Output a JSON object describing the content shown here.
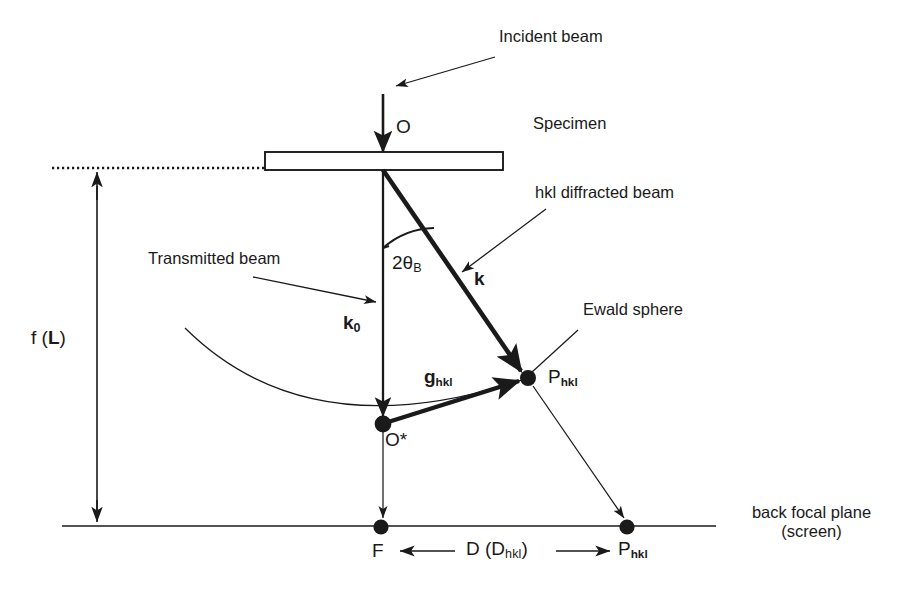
{
  "figure": {
    "type": "ray-diagram",
    "background_color": "#ffffff",
    "line_color": "#1a1a1a"
  },
  "labels": {
    "incident_beam": "Incident beam",
    "specimen": "Specimen",
    "point_O": "O",
    "hkl_diffracted_beam": "hkl diffracted beam",
    "transmitted_beam": "Transmitted beam",
    "bragg_angle": "2θ",
    "bragg_angle_sub": "B",
    "vector_k": "k",
    "vector_k0": "k",
    "vector_k0_sub": "0",
    "vector_g": "g",
    "vector_g_sub": "hkl",
    "point_O_star": "O*",
    "ewald_sphere": "Ewald sphere",
    "point_P_upper": "P",
    "point_P_upper_sub": "hkl",
    "focal_length": "f (",
    "focal_length_bold": "L",
    "focal_length_close": ")",
    "point_F": "F",
    "distance_D": "D (D",
    "distance_D_sub": "hkl",
    "distance_D_close": ")",
    "point_P_lower": "P",
    "point_P_lower_sub": "hkl",
    "back_focal_plane_line1": "back focal plane",
    "back_focal_plane_line2": "(screen)"
  },
  "geometry": {
    "optic_axis_x": 383,
    "specimen_plane_y": 161,
    "back_focal_plane_y": 526,
    "point_O": [
      383,
      161
    ],
    "point_O_star": [
      383,
      424
    ],
    "point_P_upper": [
      528,
      378
    ],
    "point_F": [
      380,
      527
    ],
    "point_P_lower": [
      627,
      527
    ],
    "dimension_line_x": 97,
    "dotted_line_y": 168,
    "two_theta_b_degrees": 35
  }
}
